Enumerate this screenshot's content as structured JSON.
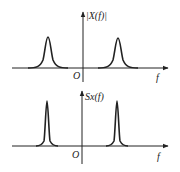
{
  "diagrams": [
    {
      "id": "top",
      "y_label": "|X(f)|",
      "x_label": "f",
      "origin_label": "O",
      "peak_shape": "broad",
      "peak_positions": [
        "-f0",
        "+f0"
      ]
    },
    {
      "id": "bottom",
      "y_label": "Sx(f)",
      "x_label": "f",
      "origin_label": "O",
      "peak_shape": "narrow",
      "peak_positions": [
        "-f0",
        "+f0"
      ]
    }
  ],
  "colors": {
    "line": "#222222",
    "background": "#ffffff"
  }
}
